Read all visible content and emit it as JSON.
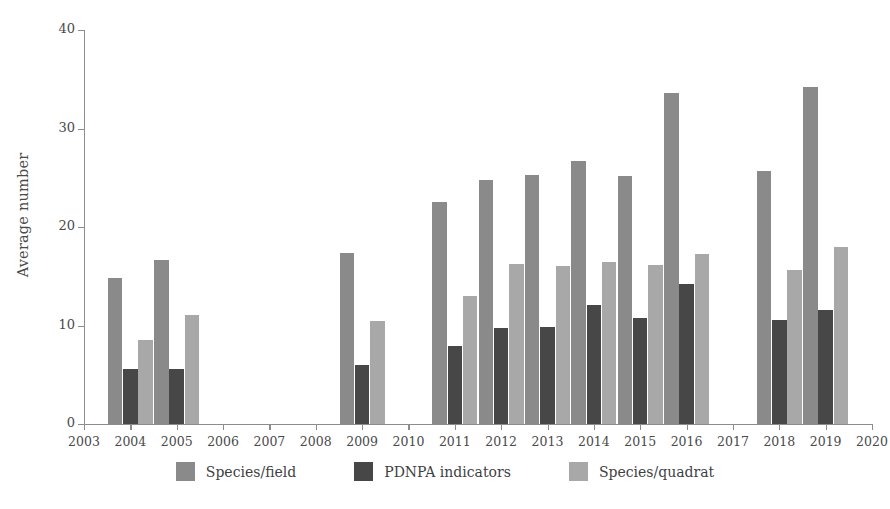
{
  "chart_data": {
    "type": "bar",
    "title": "",
    "subtitle": "",
    "xlabel": "",
    "ylabel": "Average number",
    "ylim": [
      0,
      40
    ],
    "yticks": [
      0,
      10,
      20,
      30,
      40
    ],
    "ytick_labels": [
      "0",
      "10",
      "20",
      "30",
      "40"
    ],
    "grid": false,
    "legend_position": "bottom-center",
    "axis_years": [
      "2003",
      "2004",
      "2005",
      "2006",
      "2007",
      "2008",
      "2009",
      "2010",
      "2011",
      "2012",
      "2013",
      "2014",
      "2015",
      "2016",
      "2017",
      "2018",
      "2019",
      "2020"
    ],
    "categories": [
      "2004",
      "2005",
      "2009",
      "2011",
      "2012",
      "2013",
      "2014",
      "2015",
      "2016",
      "2018",
      "2019"
    ],
    "series": [
      {
        "name": "Species/field",
        "color": "#8a8a8a",
        "values": [
          14.8,
          16.7,
          17.4,
          22.5,
          24.8,
          25.3,
          26.7,
          25.2,
          33.6,
          25.7,
          34.2
        ]
      },
      {
        "name": "PDNPA indicators",
        "color": "#474747",
        "values": [
          5.6,
          5.6,
          6.0,
          7.9,
          9.7,
          9.9,
          12.1,
          10.8,
          14.2,
          10.6,
          11.6
        ]
      },
      {
        "name": "Species/quadrat",
        "color": "#a8a8a8",
        "values": [
          8.5,
          11.1,
          10.5,
          13.0,
          16.2,
          16.0,
          16.4,
          16.1,
          17.3,
          15.6,
          18.0
        ]
      }
    ]
  },
  "legend": {
    "items": [
      {
        "label": "Species/field",
        "color": "#8a8a8a"
      },
      {
        "label": "PDNPA indicators",
        "color": "#474747"
      },
      {
        "label": "Species/quadrat",
        "color": "#a8a8a8"
      }
    ]
  },
  "axes": {
    "y_title": "Average number",
    "axis_color": "#8d8d8d",
    "tick_text_color": "#4a4a4a"
  }
}
